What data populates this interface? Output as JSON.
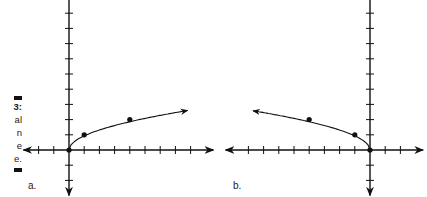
{
  "caption": {
    "lines": [
      "3:",
      "al",
      "n",
      "e",
      "e."
    ]
  },
  "panels": [
    {
      "label": "a.",
      "origin_px": [
        69,
        150
      ]
    },
    {
      "label": "b.",
      "origin_px": [
        370,
        150
      ]
    }
  ],
  "chart_data": [
    {
      "type": "line",
      "title": "a.",
      "function": "y = sqrt(x)",
      "points": [
        [
          0,
          0
        ],
        [
          1,
          1
        ],
        [
          4,
          2
        ]
      ],
      "curve_extends_to": [
        7.8,
        2.6
      ],
      "xlabel": "",
      "ylabel": "",
      "xlim": [
        -3,
        9.5
      ],
      "ylim": [
        -3,
        9.5
      ],
      "tick_spacing": 1,
      "tick_labels": "none",
      "grid": false,
      "arrow_at_end": true
    },
    {
      "type": "line",
      "title": "b.",
      "function": "y = sqrt(-x)",
      "points": [
        [
          0,
          0
        ],
        [
          -1,
          1
        ],
        [
          -4,
          2
        ]
      ],
      "curve_extends_to": [
        -7.7,
        2.6
      ],
      "xlabel": "",
      "ylabel": "",
      "xlim": [
        -9.5,
        3.5
      ],
      "ylim": [
        -3,
        9.5
      ],
      "tick_spacing": 1,
      "tick_labels": "none",
      "grid": false,
      "arrow_at_end": true
    }
  ]
}
